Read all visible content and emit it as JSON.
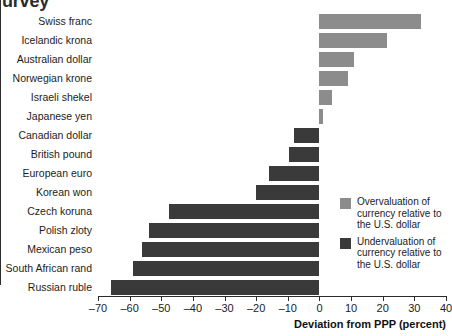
{
  "title_fragment": "urvey",
  "legend": {
    "items": [
      {
        "key": "pos",
        "color": "#8c8c8c",
        "label": "Overvaluation of currency relative to the U.S. dollar"
      },
      {
        "key": "neg",
        "color": "#3a3a3a",
        "label": "Undervaluation of currency relative to the U.S. dollar"
      }
    ]
  },
  "axis": {
    "xlabel": "Deviation from PPP (percent)",
    "ticks": [
      "–70",
      "–60",
      "–50",
      "–40",
      "–30",
      "–20",
      "–10",
      "0",
      "10",
      "20",
      "30",
      "40"
    ]
  },
  "colors": {
    "overvaluation": "#8c8c8c",
    "undervaluation": "#3a3a3a",
    "axis": "#2b2b2b",
    "background": "#ffffff"
  },
  "chart_data": {
    "type": "bar",
    "orientation": "horizontal",
    "title": "urvey",
    "xlabel": "Deviation from PPP (percent)",
    "ylabel": "",
    "xlim": [
      -70,
      40
    ],
    "xticks": [
      -70,
      -60,
      -50,
      -40,
      -30,
      -20,
      -10,
      0,
      10,
      20,
      30,
      40
    ],
    "grid": false,
    "legend_position": "right",
    "categories": [
      "Swiss franc",
      "Icelandic krona",
      "Australian dollar",
      "Norwegian krone",
      "Israeli shekel",
      "Japanese yen",
      "Canadian dollar",
      "British pound",
      "European euro",
      "Korean won",
      "Czech koruna",
      "Polish zloty",
      "Mexican peso",
      "South African rand",
      "Russian ruble"
    ],
    "values": [
      32,
      21.5,
      11,
      9,
      4,
      1,
      -8,
      -9.5,
      -16,
      -20,
      -47.5,
      -54,
      -56,
      -59,
      -66
    ],
    "series": [
      {
        "name": "Deviation from PPP",
        "values": [
          32,
          21.5,
          11,
          9,
          4,
          1,
          -8,
          -9.5,
          -16,
          -20,
          -47.5,
          -54,
          -56,
          -59,
          -66
        ]
      }
    ]
  }
}
